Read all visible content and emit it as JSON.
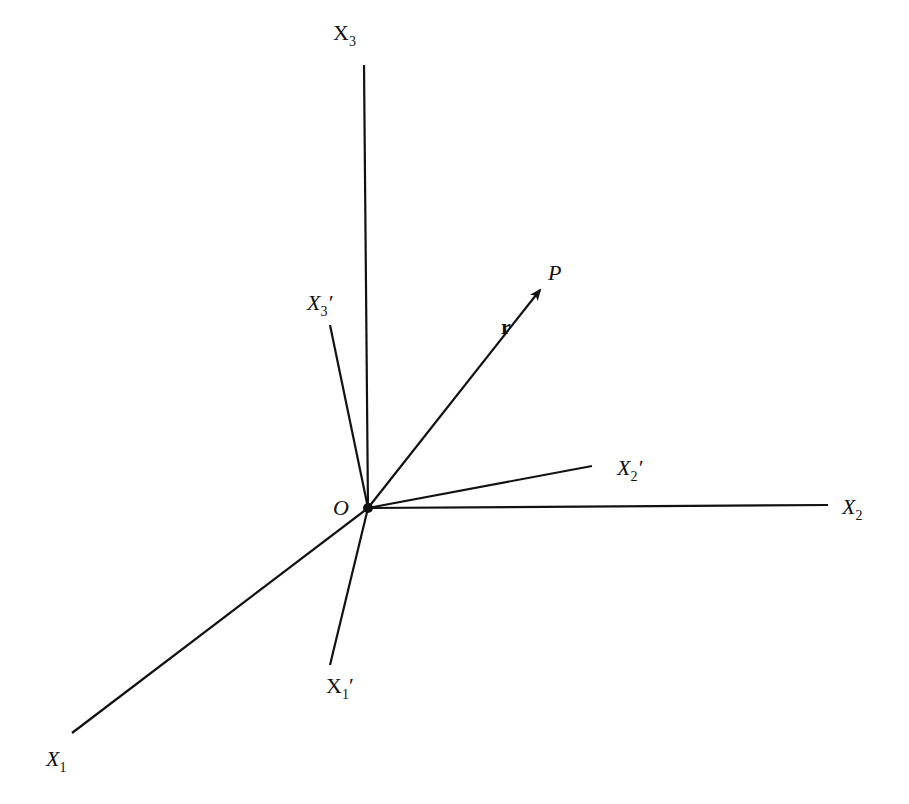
{
  "diagram": {
    "origin": {
      "label": "O",
      "x": 368,
      "y": 508
    },
    "axes": [
      {
        "id": "X3",
        "base": "X",
        "sub": "3",
        "prime": "",
        "italic": false,
        "end": [
          364,
          65
        ],
        "label_pos": [
          333,
          22
        ]
      },
      {
        "id": "X2",
        "base": "X",
        "sub": "2",
        "prime": "",
        "italic": true,
        "end": [
          828,
          505
        ],
        "label_pos": [
          842,
          496
        ]
      },
      {
        "id": "X1",
        "base": "X",
        "sub": "1",
        "prime": "",
        "italic": true,
        "end": [
          72,
          733
        ],
        "label_pos": [
          46,
          748
        ]
      },
      {
        "id": "X3p",
        "base": "X",
        "sub": "3",
        "prime": "′",
        "italic": true,
        "end": [
          330,
          325
        ],
        "label_pos": [
          307,
          292
        ]
      },
      {
        "id": "X2p",
        "base": "X",
        "sub": "2",
        "prime": "′",
        "italic": true,
        "end": [
          592,
          466
        ],
        "label_pos": [
          617,
          457
        ]
      },
      {
        "id": "X1p",
        "base": "X",
        "sub": "1",
        "prime": "′",
        "italic": false,
        "end": [
          330,
          665
        ],
        "label_pos": [
          326,
          675
        ]
      }
    ],
    "vector": {
      "label": "r",
      "point_label": "P",
      "end": [
        540,
        290
      ],
      "label_pos": [
        501,
        316
      ],
      "point_pos": [
        548,
        262
      ]
    },
    "stroke_color": "#111111"
  }
}
